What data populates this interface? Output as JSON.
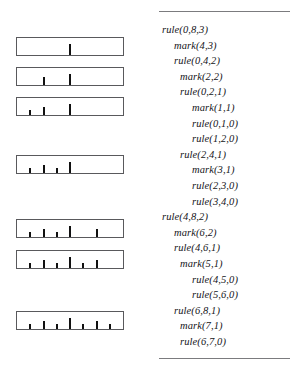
{
  "figure": {
    "rulers": [
      {
        "name": "ruler-row-1",
        "top": 37,
        "ticks": [
          {
            "pos": 50,
            "height": 11
          }
        ]
      },
      {
        "name": "ruler-row-2",
        "top": 67,
        "ticks": [
          {
            "pos": 25,
            "height": 8
          },
          {
            "pos": 50,
            "height": 11
          }
        ]
      },
      {
        "name": "ruler-row-3",
        "top": 97,
        "ticks": [
          {
            "pos": 12.5,
            "height": 5
          },
          {
            "pos": 25,
            "height": 8
          },
          {
            "pos": 50,
            "height": 11
          }
        ]
      },
      {
        "name": "ruler-row-4",
        "top": 155,
        "ticks": [
          {
            "pos": 12.5,
            "height": 5
          },
          {
            "pos": 25,
            "height": 8
          },
          {
            "pos": 37.5,
            "height": 5
          },
          {
            "pos": 50,
            "height": 11
          }
        ]
      },
      {
        "name": "ruler-row-5",
        "top": 219,
        "ticks": [
          {
            "pos": 12.5,
            "height": 5
          },
          {
            "pos": 25,
            "height": 8
          },
          {
            "pos": 37.5,
            "height": 5
          },
          {
            "pos": 50,
            "height": 11
          },
          {
            "pos": 75,
            "height": 8
          }
        ]
      },
      {
        "name": "ruler-row-6",
        "top": 250,
        "ticks": [
          {
            "pos": 12.5,
            "height": 5
          },
          {
            "pos": 25,
            "height": 8
          },
          {
            "pos": 37.5,
            "height": 5
          },
          {
            "pos": 50,
            "height": 11
          },
          {
            "pos": 62.5,
            "height": 5
          },
          {
            "pos": 75,
            "height": 8
          }
        ]
      },
      {
        "name": "ruler-row-7",
        "top": 311,
        "ticks": [
          {
            "pos": 12.5,
            "height": 5
          },
          {
            "pos": 25,
            "height": 8
          },
          {
            "pos": 37.5,
            "height": 5
          },
          {
            "pos": 50,
            "height": 11
          },
          {
            "pos": 62.5,
            "height": 5
          },
          {
            "pos": 75,
            "height": 8
          },
          {
            "pos": 87.5,
            "height": 5
          }
        ]
      }
    ],
    "trace": {
      "lines": [
        {
          "text": "rule(0,8,3)",
          "depth": 0
        },
        {
          "text": "mark(4,3)",
          "depth": 1
        },
        {
          "text": "rule(0,4,2)",
          "depth": 1
        },
        {
          "text": "mark(2,2)",
          "depth": 2
        },
        {
          "text": "rule(0,2,1)",
          "depth": 2
        },
        {
          "text": "mark(1,1)",
          "depth": 3
        },
        {
          "text": "rule(0,1,0)",
          "depth": 3
        },
        {
          "text": "rule(1,2,0)",
          "depth": 3
        },
        {
          "text": "rule(2,4,1)",
          "depth": 2
        },
        {
          "text": "mark(3,1)",
          "depth": 3
        },
        {
          "text": "rule(2,3,0)",
          "depth": 3
        },
        {
          "text": "rule(3,4,0)",
          "depth": 3
        },
        {
          "text": "rule(4,8,2)",
          "depth": 0
        },
        {
          "text": "mark(6,2)",
          "depth": 1
        },
        {
          "text": "rule(4,6,1)",
          "depth": 1
        },
        {
          "text": "mark(5,1)",
          "depth": 2
        },
        {
          "text": "rule(4,5,0)",
          "depth": 3
        },
        {
          "text": "rule(5,6,0)",
          "depth": 3
        },
        {
          "text": "rule(6,8,1)",
          "depth": 1
        },
        {
          "text": "mark(7,1)",
          "depth": 2
        },
        {
          "text": "rule(6,7,0)",
          "depth": 2
        }
      ]
    },
    "colors": {
      "box_border": "#59595c",
      "tick": "#111111",
      "rule_line": "#7b7b7e",
      "text": "#15151a",
      "background": "#ffffff"
    }
  }
}
